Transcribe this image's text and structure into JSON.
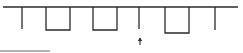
{
  "diagram": {
    "type": "comb-waveform",
    "stroke_color": "#2a2a2a",
    "baseline": {
      "x1": 3,
      "x2": 238,
      "y": 7
    },
    "ticks": [
      {
        "x": 22,
        "y_end": 29
      },
      {
        "x": 139,
        "y_end": 29
      },
      {
        "x": 215,
        "y_end": 30
      }
    ],
    "notches": [
      {
        "x1": 46,
        "x2": 70,
        "y_bottom": 30
      },
      {
        "x1": 93,
        "x2": 117,
        "y_bottom": 30
      },
      {
        "x1": 165,
        "x2": 189,
        "y_bottom": 33
      }
    ],
    "marker": {
      "icon": "up-arrow-icon",
      "x": 140,
      "y_top": 38,
      "y_bottom": 45
    },
    "scale_bar": {
      "x1": 0,
      "x2": 50,
      "y": 51,
      "color": "#9a9a9a"
    }
  }
}
